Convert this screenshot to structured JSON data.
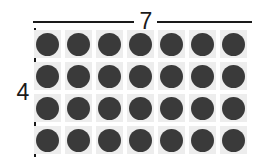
{
  "figure": {
    "type": "array-dot-diagram",
    "rows": 4,
    "columns": 7,
    "total_dots": 28,
    "dot_color": "#3a3a3a",
    "cell_color": "#ededed",
    "line_color": "#1a1a1a",
    "background_color": "#ffffff"
  },
  "top_dimension": {
    "label": "7",
    "orientation": "horizontal",
    "name": "columns-dimension"
  },
  "left_dimension": {
    "label": "4",
    "orientation": "vertical",
    "name": "rows-dimension"
  },
  "grid": {
    "rows": [
      {
        "dots": [
          "dot",
          "dot",
          "dot",
          "dot",
          "dot",
          "dot",
          "dot"
        ]
      },
      {
        "dots": [
          "dot",
          "dot",
          "dot",
          "dot",
          "dot",
          "dot",
          "dot"
        ]
      },
      {
        "dots": [
          "dot",
          "dot",
          "dot",
          "dot",
          "dot",
          "dot",
          "dot"
        ]
      },
      {
        "dots": [
          "dot",
          "dot",
          "dot",
          "dot",
          "dot",
          "dot",
          "dot"
        ]
      }
    ]
  }
}
